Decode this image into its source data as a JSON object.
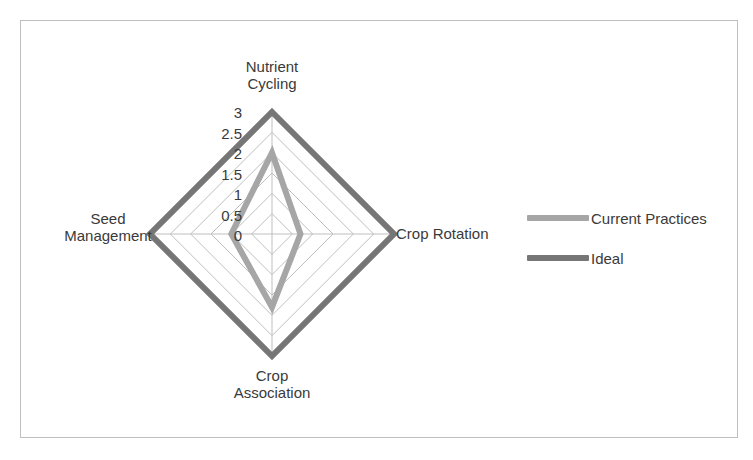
{
  "frame": {
    "border_color": "#bfbfbf",
    "background": "#ffffff"
  },
  "legend": {
    "position": "right",
    "items": [
      {
        "label": "Current Practices",
        "color": "#a6a6a6"
      },
      {
        "label": "Ideal",
        "color": "#767676"
      }
    ]
  },
  "axis": {
    "tick_labels": [
      "3",
      "2.5",
      "2",
      "1.5",
      "1",
      "0.5",
      "0"
    ],
    "grid_color": "#bfbfbf"
  },
  "categories": {
    "top": "Nutrient\nCycling",
    "right": "Crop Rotation",
    "bottom": "Crop\nAssociation",
    "left": "Seed\nManagement"
  },
  "chart_data": {
    "type": "radar",
    "title": "",
    "categories": [
      "Nutrient Cycling",
      "Crop Rotation",
      "Crop Association",
      "Seed Management"
    ],
    "series": [
      {
        "name": "Current Practices",
        "values": [
          2,
          0.7,
          1.8,
          1
        ],
        "color": "#a6a6a6"
      },
      {
        "name": "Ideal",
        "values": [
          3,
          3,
          3,
          3
        ],
        "color": "#767676"
      }
    ],
    "rlim": [
      0,
      3
    ],
    "r_ticks": [
      0,
      0.5,
      1,
      1.5,
      2,
      2.5,
      3
    ],
    "grid": true,
    "legend_position": "right",
    "xlabel": "",
    "ylabel": ""
  }
}
